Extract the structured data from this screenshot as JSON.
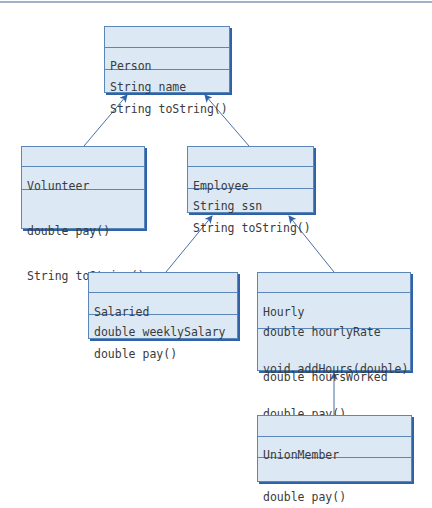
{
  "diagram": {
    "type": "uml-class-diagram",
    "classes": {
      "person": {
        "name": "Person",
        "attributes": [
          "String name"
        ],
        "methods": [
          "String toString()"
        ]
      },
      "volunteer": {
        "name": "Volunteer",
        "attributes": [],
        "methods": [
          "double pay()",
          "String toString()"
        ]
      },
      "employee": {
        "name": "Employee",
        "attributes": [
          "String ssn"
        ],
        "methods": [
          "String toString()"
        ]
      },
      "salaried": {
        "name": "Salaried",
        "attributes": [
          "double weeklySalary"
        ],
        "methods": [
          "double pay()"
        ]
      },
      "hourly": {
        "name": "Hourly",
        "attributes": [
          "double hourlyRate",
          "double hoursWorked"
        ],
        "methods": [
          "void addHours(double)",
          "double pay()"
        ]
      },
      "union_member": {
        "name": "UnionMember",
        "attributes": [],
        "methods": [
          "double pay()"
        ]
      }
    },
    "inheritance": [
      {
        "child": "Volunteer",
        "parent": "Person"
      },
      {
        "child": "Employee",
        "parent": "Person"
      },
      {
        "child": "Salaried",
        "parent": "Employee"
      },
      {
        "child": "Hourly",
        "parent": "Employee"
      },
      {
        "child": "UnionMember",
        "parent": "Hourly"
      }
    ],
    "colors": {
      "box_fill": "#dce9f5",
      "box_border": "#5b86b8",
      "box_shadow": "#2f62a8",
      "arrow": "#4a6fa0",
      "text": "#3b3b3b"
    }
  }
}
